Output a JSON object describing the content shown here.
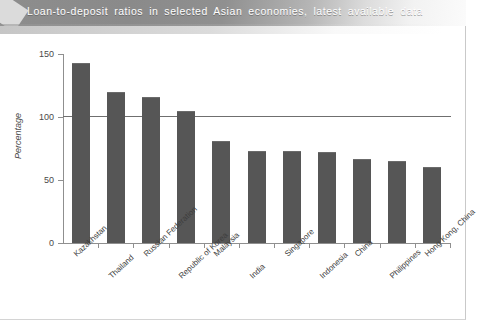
{
  "title": "Loan-to-deposit ratios in selected Asian economies, latest available data",
  "colors": {
    "bar": "#565656",
    "axis": "#8f8f8f",
    "reference_line": "#6f6f6f",
    "banner_text": "#ffffff",
    "tick_text": "#4a4a4a"
  },
  "axis": {
    "y_title": "Percentage",
    "y_ticks": [
      "0",
      "50",
      "100",
      "150"
    ]
  },
  "chart_data": {
    "type": "bar",
    "title": "Loan-to-deposit ratios in selected Asian economies, latest available data",
    "xlabel": "",
    "ylabel": "Percentage",
    "ylim": [
      0,
      150
    ],
    "yticks": [
      0,
      50,
      100,
      150
    ],
    "grid": false,
    "legend": null,
    "reference_line": {
      "value": 100,
      "orientation": "horizontal"
    },
    "categories": [
      "Kazakhstan",
      "Thailand",
      "Russian Federation",
      "Republic of Korea",
      "Malaysia",
      "India",
      "Singapore",
      "Indonesia",
      "China",
      "Philippines",
      "Hong Kong, China"
    ],
    "values": [
      143,
      120,
      116,
      105,
      81,
      73,
      73,
      72,
      67,
      65,
      60
    ]
  }
}
